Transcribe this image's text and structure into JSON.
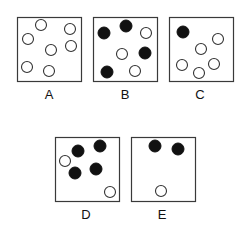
{
  "figure": {
    "boxes": [
      {
        "label": "A",
        "x": 17,
        "y": 17,
        "w": 64,
        "h": 64,
        "label_pos": [
          49,
          95
        ],
        "circles": [
          {
            "cx": 41,
            "cy": 25,
            "filled": false
          },
          {
            "cx": 70,
            "cy": 29,
            "filled": false
          },
          {
            "cx": 28,
            "cy": 39,
            "filled": false
          },
          {
            "cx": 51,
            "cy": 50,
            "filled": false
          },
          {
            "cx": 71,
            "cy": 46,
            "filled": false
          },
          {
            "cx": 27,
            "cy": 67,
            "filled": false
          },
          {
            "cx": 49,
            "cy": 71,
            "filled": false
          }
        ]
      },
      {
        "label": "B",
        "x": 93,
        "y": 17,
        "w": 64,
        "h": 64,
        "label_pos": [
          125,
          95
        ],
        "circles": [
          {
            "cx": 104,
            "cy": 33,
            "filled": true
          },
          {
            "cx": 126,
            "cy": 26,
            "filled": true
          },
          {
            "cx": 146,
            "cy": 33,
            "filled": false
          },
          {
            "cx": 122,
            "cy": 54,
            "filled": false
          },
          {
            "cx": 145,
            "cy": 53,
            "filled": true
          },
          {
            "cx": 107,
            "cy": 72,
            "filled": true
          },
          {
            "cx": 135,
            "cy": 71,
            "filled": false
          }
        ]
      },
      {
        "label": "C",
        "x": 169,
        "y": 17,
        "w": 64,
        "h": 64,
        "label_pos": [
          200,
          95
        ],
        "circles": [
          {
            "cx": 183,
            "cy": 32,
            "filled": true
          },
          {
            "cx": 218,
            "cy": 39,
            "filled": false
          },
          {
            "cx": 201,
            "cy": 49,
            "filled": false
          },
          {
            "cx": 182,
            "cy": 65,
            "filled": false
          },
          {
            "cx": 214,
            "cy": 64,
            "filled": false
          },
          {
            "cx": 199,
            "cy": 73,
            "filled": false
          }
        ]
      },
      {
        "label": "D",
        "x": 55,
        "y": 137,
        "w": 64,
        "h": 64,
        "label_pos": [
          86,
          215
        ],
        "circles": [
          {
            "cx": 78,
            "cy": 151,
            "filled": true
          },
          {
            "cx": 100,
            "cy": 146,
            "filled": true
          },
          {
            "cx": 65,
            "cy": 161,
            "filled": false
          },
          {
            "cx": 75,
            "cy": 173,
            "filled": true
          },
          {
            "cx": 96,
            "cy": 169,
            "filled": true
          },
          {
            "cx": 110,
            "cy": 192,
            "filled": false
          }
        ]
      },
      {
        "label": "E",
        "x": 131,
        "y": 137,
        "w": 64,
        "h": 64,
        "label_pos": [
          162,
          215
        ],
        "circles": [
          {
            "cx": 155,
            "cy": 146,
            "filled": true
          },
          {
            "cx": 178,
            "cy": 149,
            "filled": true
          },
          {
            "cx": 161,
            "cy": 191,
            "filled": false
          }
        ]
      }
    ],
    "circle_radius": 5.5,
    "colors": {
      "frame": "#3a3a3a",
      "filled": "#111111",
      "hollow_stroke": "#333333",
      "background": "#ffffff"
    }
  }
}
